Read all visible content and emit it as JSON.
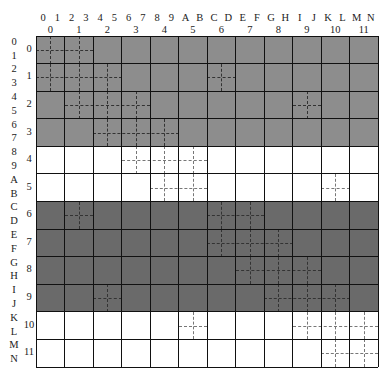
{
  "diagram": {
    "coarse_cols": 12,
    "coarse_rows": 12,
    "fine_col_labels": [
      "0",
      "1",
      "2",
      "3",
      "4",
      "5",
      "6",
      "7",
      "8",
      "9",
      "A",
      "B",
      "C",
      "D",
      "E",
      "F",
      "G",
      "H",
      "I",
      "J",
      "K",
      "L",
      "M",
      "N"
    ],
    "fine_row_labels": [
      "0",
      "1",
      "2",
      "3",
      "4",
      "5",
      "6",
      "7",
      "8",
      "9",
      "A",
      "B",
      "C",
      "D",
      "E",
      "F",
      "G",
      "H",
      "I",
      "J",
      "K",
      "L",
      "M",
      "N"
    ],
    "coarse_col_labels": [
      "0",
      "1",
      "2",
      "3",
      "4",
      "5",
      "6",
      "7",
      "8",
      "9",
      "10",
      "11"
    ],
    "coarse_row_labels": [
      "0",
      "1",
      "2",
      "3",
      "4",
      "5",
      "6",
      "7",
      "8",
      "9",
      "10",
      "11"
    ],
    "colors": {
      "band_light_gray": "#8d8d8d",
      "band_white": "#ffffff",
      "band_dark_gray": "#6a6a6a",
      "grid_line": "#111111",
      "dotted_line": "#333333"
    },
    "row_bands": [
      {
        "rows": [
          0,
          1,
          2,
          3
        ],
        "fill": "band_light_gray"
      },
      {
        "rows": [
          4,
          5
        ],
        "fill": "band_white"
      },
      {
        "rows": [
          6,
          7,
          8,
          9
        ],
        "fill": "band_dark_gray"
      },
      {
        "rows": [
          10,
          11
        ],
        "fill": "band_white"
      }
    ],
    "subdivided_cells": [
      {
        "row": 0,
        "cols": [
          0,
          1
        ]
      },
      {
        "row": 1,
        "cols": [
          0,
          1,
          2
        ]
      },
      {
        "row": 1,
        "cols": [
          6
        ]
      },
      {
        "row": 2,
        "cols": [
          1,
          2,
          3
        ]
      },
      {
        "row": 2,
        "cols": [
          9
        ]
      },
      {
        "row": 3,
        "cols": [
          2,
          3,
          4
        ]
      },
      {
        "row": 4,
        "cols": [
          3,
          4,
          5
        ]
      },
      {
        "row": 5,
        "cols": [
          4,
          5
        ]
      },
      {
        "row": 5,
        "cols": [
          10
        ]
      },
      {
        "row": 6,
        "cols": [
          1
        ]
      },
      {
        "row": 6,
        "cols": [
          6,
          7
        ]
      },
      {
        "row": 7,
        "cols": [
          6,
          7,
          8
        ]
      },
      {
        "row": 8,
        "cols": [
          7,
          8,
          9
        ]
      },
      {
        "row": 9,
        "cols": [
          2
        ]
      },
      {
        "row": 9,
        "cols": [
          8,
          9,
          10
        ]
      },
      {
        "row": 10,
        "cols": [
          5
        ]
      },
      {
        "row": 10,
        "cols": [
          9,
          10,
          11
        ]
      },
      {
        "row": 11,
        "cols": [
          10,
          11
        ]
      }
    ]
  }
}
